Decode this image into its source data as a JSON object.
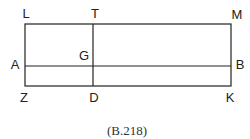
{
  "figure": {
    "caption": "(B.218)",
    "points": {
      "L": "L",
      "T": "T",
      "M": "M",
      "G": "G",
      "A": "A",
      "B": "B",
      "Z": "Z",
      "D": "D",
      "K": "K"
    },
    "segments": [
      "LM",
      "ZK",
      "LZ",
      "MK",
      "AB",
      "TD"
    ],
    "line_color": "#222222"
  }
}
